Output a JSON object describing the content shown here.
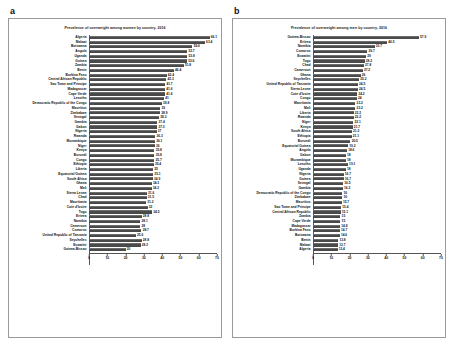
{
  "figure": {
    "panels": [
      {
        "letter": "a",
        "title": "Prevalence of overweight among women by country, 2016"
      },
      {
        "letter": "b",
        "title": "Prevalence of overweight among men by country, 2016"
      }
    ]
  },
  "chart_data": [
    {
      "type": "bar",
      "orientation": "horizontal",
      "panel": "a",
      "title": "Prevalence of overweight among women by country, 2016",
      "xlabel": "",
      "ylabel": "",
      "xlim": [
        0,
        70
      ],
      "xticks": [
        0,
        10,
        20,
        30,
        40,
        50,
        60,
        70
      ],
      "grid": false,
      "legend": "none",
      "bar_color": "#4a4a4a",
      "categories": [
        "Algeria",
        "Malawi",
        "Botswana",
        "Angola",
        "Uganda",
        "Guinea",
        "Zambia",
        "Benin",
        "Burkina Faso",
        "Central African Republic",
        "Sao Tome and Principe",
        "Madagascar",
        "Cape Verde",
        "Lesotho",
        "Democratic Republic of the Congo",
        "Mauritius",
        "Zimbabwe",
        "Senegal",
        "Gambia",
        "Gabon",
        "Nigeria",
        "Rwanda",
        "Mozambique",
        "Niger",
        "Kenya",
        "Burundi",
        "Congo",
        "Ethiopia",
        "Liberia",
        "Equatorial Guinea",
        "South Africa",
        "Ghana",
        "Mali",
        "Sierra Leone",
        "Chad",
        "Mauritania",
        "Cote d'Ivoire",
        "Togo",
        "Eritrea",
        "Namibia",
        "Cameroon",
        "Comoros",
        "United Republic of Tanzania",
        "Seychelles",
        "Eswatini",
        "Guinea-Bissau"
      ],
      "values": [
        66.1,
        63.4,
        56.6,
        53.7,
        53.8,
        53.6,
        51.8,
        46.4,
        42.4,
        42.3,
        41.7,
        41.6,
        41.6,
        41.0,
        39.8,
        39.0,
        38.9,
        38.3,
        37.4,
        37.3,
        37.0,
        36.3,
        36.1,
        36.0,
        35.8,
        35.8,
        35.7,
        35.4,
        35.0,
        35.1,
        34.9,
        34.3,
        34.2,
        31.6,
        31.5,
        31.2,
        32.0,
        34.5,
        28.8,
        28.1,
        28.0,
        28.7,
        25.6,
        28.8,
        28.2,
        20.0
      ]
    },
    {
      "type": "bar",
      "orientation": "horizontal",
      "panel": "b",
      "title": "Prevalence of overweight among men by country, 2016",
      "xlabel": "",
      "ylabel": "",
      "xlim": [
        0,
        70
      ],
      "xticks": [
        0,
        10,
        20,
        30,
        40,
        50,
        60,
        70
      ],
      "grid": false,
      "legend": "none",
      "bar_color": "#4a4a4a",
      "categories": [
        "Guinea-Bissau",
        "Eritrea",
        "Namibia",
        "Comoros",
        "Eswatini",
        "Togo",
        "Chad",
        "Cameroon",
        "Ghana",
        "Seychelles",
        "United Republic of Tanzania",
        "Sierra Leone",
        "Cote d'Ivoire",
        "Congo",
        "Mauritania",
        "Mali",
        "Liberia",
        "Rwanda",
        "Niger",
        "Kenya",
        "South Africa",
        "Ethiopia",
        "Burundi",
        "Equatorial Guinea",
        "Angola",
        "Gabon",
        "Mozambique",
        "Lesotho",
        "Uganda",
        "Nigeria",
        "Guinea",
        "Senegal",
        "Gambia",
        "Democratic Republic of the Congo",
        "Zimbabwe",
        "Mauritius",
        "Sao Tome and Principe",
        "Central African Republic",
        "Zambia",
        "Cape Verde",
        "Madagascar",
        "Burkina Faso",
        "Botswana",
        "Benin",
        "Malawi",
        "Algeria"
      ],
      "values": [
        57.9,
        40.5,
        33.7,
        29.7,
        29.0,
        28.2,
        27.8,
        27.2,
        26.0,
        25.2,
        24.5,
        24.5,
        24.2,
        24.0,
        23.2,
        23.2,
        22.2,
        22.2,
        22.1,
        21.7,
        21.2,
        21.1,
        20.5,
        19.2,
        18.6,
        18.0,
        18.0,
        19.1,
        18.0,
        16.7,
        16.7,
        16.5,
        16.3,
        16.0,
        16.0,
        15.7,
        15.4,
        15.1,
        15.0,
        15.0,
        14.8,
        14.7,
        14.6,
        13.8,
        13.7,
        13.4
      ]
    }
  ]
}
